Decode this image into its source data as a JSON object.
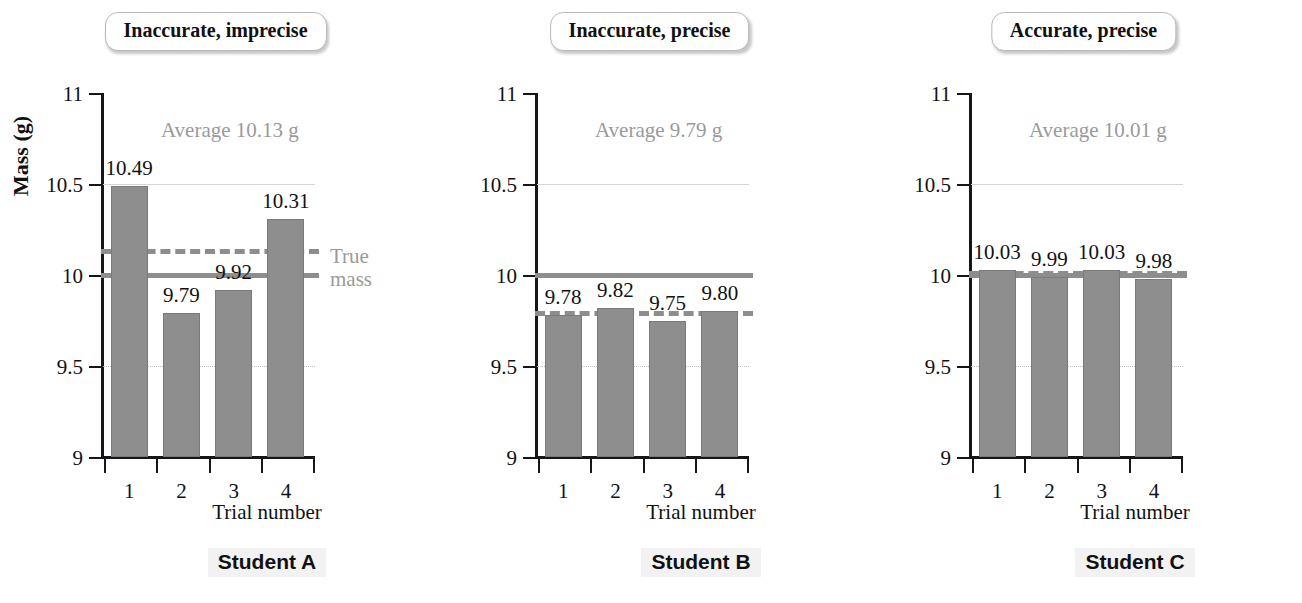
{
  "figure": {
    "axis_title_y": "Mass (g)",
    "axis_title_x": "Trial number",
    "true_mass_note_line1": "True",
    "true_mass_note_line2": "mass",
    "colors": {
      "bar_fill": "#8e8e8e",
      "bar_stroke": "#7a7a7a",
      "true_mass_line": "#8d8d8d",
      "average_line": "#8d8d8d",
      "gridline": "#d5d5d5",
      "axis": "#16161a",
      "annotation_gray": "#9a9a9a"
    }
  },
  "y_ticks": [
    "11",
    "10.5",
    "10",
    "9.5",
    "9"
  ],
  "x_ticks": [
    "1",
    "2",
    "3",
    "4"
  ],
  "panels": [
    {
      "title": "Inaccurate, imprecise",
      "caption": "Student A",
      "average_label": "Average 10.13 g",
      "average_value": 10.13,
      "true_mass": 10.0,
      "values": [
        10.49,
        9.79,
        9.92,
        10.31
      ],
      "value_labels": [
        "10.49",
        "9.79",
        "9.92",
        "10.31"
      ]
    },
    {
      "title": "Inaccurate, precise",
      "caption": "Student B",
      "average_label": "Average 9.79 g",
      "average_value": 9.79,
      "true_mass": 10.0,
      "values": [
        9.78,
        9.82,
        9.75,
        9.8
      ],
      "value_labels": [
        "9.78",
        "9.82",
        "9.75",
        "9.80"
      ]
    },
    {
      "title": "Accurate, precise",
      "caption": "Student C",
      "average_label": "Average 10.01 g",
      "average_value": 10.01,
      "true_mass": 10.0,
      "values": [
        10.03,
        9.99,
        10.03,
        9.98
      ],
      "value_labels": [
        "10.03",
        "9.99",
        "10.03",
        "9.98"
      ]
    }
  ],
  "chart_data": {
    "type": "bar",
    "xlabel": "Trial number",
    "ylabel": "Mass (g)",
    "ylim": [
      9,
      11
    ],
    "yticks": [
      9,
      9.5,
      10,
      10.5,
      11
    ],
    "categories": [
      "1",
      "2",
      "3",
      "4"
    ],
    "grid": "horizontal gridlines at 10.5 (faint solid) and 9.5 (faint dotted)",
    "legend": "none; inline annotations only",
    "reference_lines": [
      {
        "name": "True mass",
        "value": 10.0,
        "style": "solid gray, labeled 'True mass' at right of first panel"
      },
      {
        "name": "Average",
        "style": "dashed gray, one per panel at that panel's average"
      }
    ],
    "series": [
      {
        "name": "Student A",
        "panel_title": "Inaccurate, imprecise",
        "values": [
          10.49,
          9.79,
          9.92,
          10.31
        ],
        "average": 10.13
      },
      {
        "name": "Student B",
        "panel_title": "Inaccurate, precise",
        "values": [
          9.78,
          9.82,
          9.75,
          9.8
        ],
        "average": 9.79
      },
      {
        "name": "Student C",
        "panel_title": "Accurate, precise",
        "values": [
          10.03,
          9.99,
          10.03,
          9.98
        ],
        "average": 10.01
      }
    ],
    "annotations": [
      "Average 10.13 g",
      "Average 9.79 g",
      "Average 10.01 g",
      "True mass"
    ]
  }
}
